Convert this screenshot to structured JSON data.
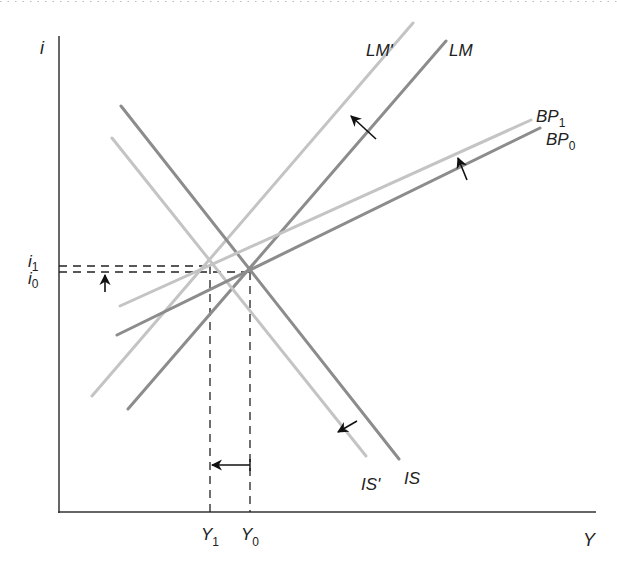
{
  "diagram": {
    "type": "IS-LM-BP",
    "axes": {
      "y_label": "i",
      "x_label": "Y",
      "y_ticks": [
        {
          "label": "i",
          "sub": "1",
          "y": 266
        },
        {
          "label": "i",
          "sub": "0",
          "y": 272
        }
      ],
      "x_ticks": [
        {
          "label": "Y",
          "sub": "1",
          "x": 210
        },
        {
          "label": "Y",
          "sub": "0",
          "x": 250
        }
      ]
    },
    "curves": [
      {
        "name": "LM",
        "label": "LM",
        "sub": "",
        "color": "#8c8c8c",
        "x1": 128,
        "y1": 409,
        "x2": 446,
        "y2": 41
      },
      {
        "name": "LM'",
        "label": "LM'",
        "sub": "",
        "color": "#c4c4c4",
        "x1": 92,
        "y1": 396,
        "x2": 413,
        "y2": 23
      },
      {
        "name": "IS",
        "label": "IS",
        "sub": "",
        "color": "#8c8c8c",
        "x1": 121,
        "y1": 106,
        "x2": 399,
        "y2": 459
      },
      {
        "name": "IS'",
        "label": "IS'",
        "sub": "",
        "color": "#c4c4c4",
        "x1": 112,
        "y1": 138,
        "x2": 366,
        "y2": 456
      },
      {
        "name": "BP0",
        "label": "BP",
        "sub": "0",
        "color": "#8c8c8c",
        "x1": 117,
        "y1": 335,
        "x2": 540,
        "y2": 128
      },
      {
        "name": "BP1",
        "label": "BP",
        "sub": "1",
        "color": "#c4c4c4",
        "x1": 120,
        "y1": 306,
        "x2": 531,
        "y2": 120
      }
    ],
    "equilibria": [
      {
        "name": "E0",
        "x": 250,
        "y": 272
      },
      {
        "name": "E1",
        "x": 210,
        "y": 266
      }
    ],
    "arrows": [
      {
        "name": "lm-shift-arrow",
        "from": [
          376,
          139
        ],
        "to": [
          351,
          116
        ]
      },
      {
        "name": "bp-shift-arrow",
        "from": [
          467,
          180
        ],
        "to": [
          458,
          158
        ]
      },
      {
        "name": "is-shift-arrow",
        "from": [
          357,
          421
        ],
        "to": [
          338,
          432
        ]
      },
      {
        "name": "i-rise-arrow",
        "from": [
          105,
          292
        ],
        "to": [
          105,
          275
        ]
      },
      {
        "name": "y-fall-arrow",
        "from": [
          250,
          465
        ],
        "to": [
          212,
          465
        ]
      }
    ]
  }
}
